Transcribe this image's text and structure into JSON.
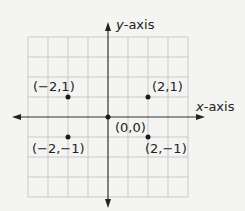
{
  "diagram": {
    "type": "coordinate-plane",
    "x_axis_label_var": "x",
    "x_axis_label_suffix": "-axis",
    "y_axis_label_var": "y",
    "y_axis_label_suffix": "-axis",
    "grid": {
      "columns": 8,
      "rows": 8,
      "origin_col": 4,
      "origin_row": 4
    },
    "points": [
      {
        "x": -2,
        "y": 1,
        "label": "(−2,1)"
      },
      {
        "x": 2,
        "y": 1,
        "label": "(2,1)"
      },
      {
        "x": 0,
        "y": 0,
        "label": "(0,0)"
      },
      {
        "x": -2,
        "y": -1,
        "label": "(−2,−1)"
      },
      {
        "x": 2,
        "y": -1,
        "label": "(2,−1)"
      }
    ],
    "colors": {
      "background": "#f4f4f2",
      "grid": "#c9c9c9",
      "axis": "#333333",
      "point": "#1a1a1a",
      "text": "#222222"
    }
  }
}
